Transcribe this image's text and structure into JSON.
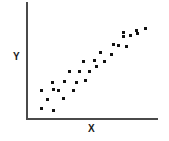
{
  "chart_data": {
    "type": "scatter",
    "title": "",
    "xlabel": "X",
    "ylabel": "Y",
    "grid": false,
    "legend": null,
    "xlim": [
      0,
      100
    ],
    "ylim": [
      0,
      100
    ],
    "tick_labels": {
      "x": [],
      "y": []
    },
    "series": [
      {
        "name": "observations",
        "marker": "square",
        "color": "#111111",
        "n": 30,
        "points": [
          {
            "x": 10.6,
            "y": 8.6
          },
          {
            "x": 19.7,
            "y": 7.0
          },
          {
            "x": 15.2,
            "y": 17.4
          },
          {
            "x": 10.6,
            "y": 26.1
          },
          {
            "x": 19.7,
            "y": 27.0
          },
          {
            "x": 27.3,
            "y": 18.3
          },
          {
            "x": 23.5,
            "y": 26.1
          },
          {
            "x": 28.0,
            "y": 34.8
          },
          {
            "x": 18.9,
            "y": 33.9
          },
          {
            "x": 34.8,
            "y": 26.1
          },
          {
            "x": 37.1,
            "y": 33.9
          },
          {
            "x": 43.9,
            "y": 35.7
          },
          {
            "x": 31.8,
            "y": 43.5
          },
          {
            "x": 39.4,
            "y": 44.3
          },
          {
            "x": 47.0,
            "y": 44.3
          },
          {
            "x": 53.0,
            "y": 48.7
          },
          {
            "x": 42.4,
            "y": 53.0
          },
          {
            "x": 50.8,
            "y": 53.9
          },
          {
            "x": 59.1,
            "y": 53.0
          },
          {
            "x": 64.4,
            "y": 60.0
          },
          {
            "x": 56.1,
            "y": 61.7
          },
          {
            "x": 69.7,
            "y": 68.7
          },
          {
            "x": 75.8,
            "y": 67.8
          },
          {
            "x": 65.9,
            "y": 69.6
          },
          {
            "x": 73.5,
            "y": 77.4
          },
          {
            "x": 78.8,
            "y": 78.3
          },
          {
            "x": 84.1,
            "y": 80.0
          },
          {
            "x": 73.5,
            "y": 80.9
          },
          {
            "x": 83.3,
            "y": 82.6
          },
          {
            "x": 90.2,
            "y": 84.3
          }
        ]
      }
    ]
  },
  "axes": {
    "x_label": "X",
    "y_label": "Y",
    "axis_color": "#4a4a4a"
  }
}
